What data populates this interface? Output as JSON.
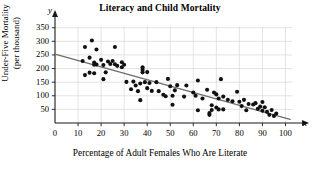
{
  "chart_data": {
    "type": "scatter",
    "title": "Literacy and Child Mortality",
    "xlabel": "Percentage of Adult Females Who Are Literate",
    "ylabel_line1": "Under-Five Mortality",
    "ylabel_line2": "(per thousand)",
    "x_axis_letter": "x",
    "y_axis_letter": "y",
    "xlim": [
      0,
      105
    ],
    "ylim": [
      0,
      360
    ],
    "xticks": [
      0,
      10,
      20,
      30,
      40,
      50,
      60,
      70,
      80,
      90,
      100
    ],
    "yticks": [
      50,
      100,
      150,
      200,
      250,
      300,
      350
    ],
    "grid": true,
    "grid_color": "#d8d8d8",
    "point_color": "#111111",
    "line_color": "#6e6e6e",
    "axis_color": "#1a1a1a",
    "trend_line": {
      "name": "least-squares regression line",
      "x_start": 0,
      "y_start": 253,
      "x_end": 102,
      "y_end": 13
    },
    "series": [
      {
        "name": "Countries",
        "points": [
          [
            12,
            228
          ],
          [
            13,
            176
          ],
          [
            13,
            279
          ],
          [
            15,
            240
          ],
          [
            15,
            185
          ],
          [
            16,
            303
          ],
          [
            17,
            222
          ],
          [
            17,
            214
          ],
          [
            17,
            183
          ],
          [
            18,
            270
          ],
          [
            18,
            215
          ],
          [
            20,
            232
          ],
          [
            21,
            213
          ],
          [
            21,
            161
          ],
          [
            22,
            186
          ],
          [
            23,
            226
          ],
          [
            24,
            217
          ],
          [
            25,
            228
          ],
          [
            26,
            279
          ],
          [
            26,
            216
          ],
          [
            27,
            210
          ],
          [
            29,
            223
          ],
          [
            29,
            205
          ],
          [
            30,
            214
          ],
          [
            31,
            151
          ],
          [
            33,
            124
          ],
          [
            34,
            152
          ],
          [
            35,
            138
          ],
          [
            36,
            117
          ],
          [
            37,
            145
          ],
          [
            37,
            84
          ],
          [
            38,
            196
          ],
          [
            38,
            205
          ],
          [
            38,
            186
          ],
          [
            39,
            150
          ],
          [
            40,
            187
          ],
          [
            40,
            128
          ],
          [
            41,
            147
          ],
          [
            42,
            118
          ],
          [
            44,
            150
          ],
          [
            45,
            117
          ],
          [
            47,
            104
          ],
          [
            48,
            98
          ],
          [
            49,
            162
          ],
          [
            50,
            135
          ],
          [
            51,
            100
          ],
          [
            51,
            67
          ],
          [
            52,
            120
          ],
          [
            53,
            139
          ],
          [
            56,
            97
          ],
          [
            57,
            138
          ],
          [
            60,
            112
          ],
          [
            61,
            100
          ],
          [
            62,
            156
          ],
          [
            62,
            47
          ],
          [
            64,
            90
          ],
          [
            66,
            122
          ],
          [
            67,
            37
          ],
          [
            67,
            30
          ],
          [
            68,
            65
          ],
          [
            68,
            48
          ],
          [
            69,
            112
          ],
          [
            70,
            105
          ],
          [
            70,
            57
          ],
          [
            71,
            90
          ],
          [
            71,
            50
          ],
          [
            72,
            161
          ],
          [
            73,
            97
          ],
          [
            73,
            50
          ],
          [
            75,
            85
          ],
          [
            77,
            80
          ],
          [
            79,
            115
          ],
          [
            80,
            78
          ],
          [
            81,
            62
          ],
          [
            82,
            85
          ],
          [
            83,
            47
          ],
          [
            84,
            70
          ],
          [
            86,
            68
          ],
          [
            87,
            73
          ],
          [
            88,
            52
          ],
          [
            89,
            60
          ],
          [
            90,
            77
          ],
          [
            90,
            45
          ],
          [
            91,
            58
          ],
          [
            92,
            41
          ],
          [
            93,
            30
          ],
          [
            94,
            48
          ],
          [
            95,
            26
          ],
          [
            96,
            35
          ]
        ]
      }
    ]
  }
}
